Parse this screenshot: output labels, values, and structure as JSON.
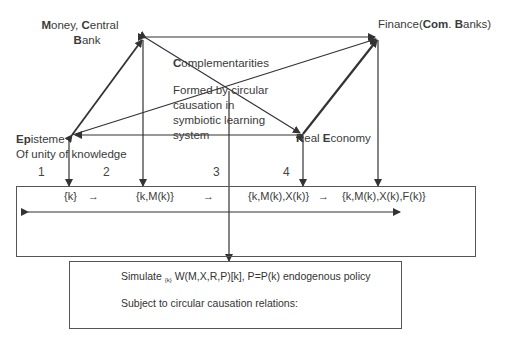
{
  "nodes": {
    "money": {
      "bold1": "M",
      "text1": "oney, ",
      "bold2": "C",
      "text2": "entral",
      "bold3": "B",
      "text3": "ank"
    },
    "finance": {
      "text1": "Finance(",
      "bold1": "Com",
      "text2": ". ",
      "bold2": "B",
      "text3": "anks)"
    },
    "episteme": {
      "bold1": "Ep",
      "text1": "isteme",
      "line2": "Of unity of knowledge"
    },
    "real_economy": {
      "bold1": "R",
      "text1": "eal ",
      "bold2": "E",
      "text2": "conomy"
    },
    "complementarities": {
      "title_bold": "C",
      "title_rest": "omplementarities",
      "desc": [
        "Formed by circular",
        "causation in",
        "symbiotic learning",
        "system"
      ]
    }
  },
  "stage_numbers": [
    "1",
    "2",
    "3",
    "4"
  ],
  "states": {
    "s1": "{k}",
    "a1": "→",
    "s2": "{k,M(k)}",
    "a2": "→",
    "s3": "{k,M(k),X(k)}",
    "a3": "→",
    "s4": "{k,M(k),X(k),F(k)}"
  },
  "simulate_box": {
    "line1_prefix": "Simulate ",
    "line1_sub": "{k}",
    "line1_rest": " W(M,X,R,P)[k], P=P(k) endogenous policy",
    "line2": "Subject to circular causation relations:"
  },
  "colors": {
    "line": "#333333",
    "text": "#3a3a3a"
  }
}
